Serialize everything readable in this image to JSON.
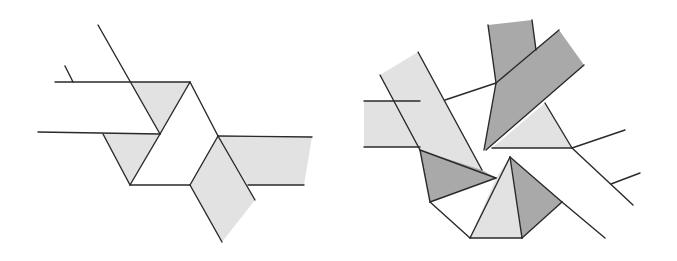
{
  "figure": {
    "colors": {
      "stroke": "#2a2a2a",
      "light_fill": "#e2e2e2",
      "dark_fill": "#a9a9a9",
      "background": "#ffffff"
    },
    "left_figure": {
      "light_regions": [
        "130,82 190,82 160,134",
        "103,134 160,134 130,185",
        "218,136 312,137 304,185 248,185",
        "218,136 190,185 222,242 255,200"
      ],
      "lines": [
        "55,82 190,82",
        "65,66 73,82",
        "98,25 160,134",
        "38,132 160,134",
        "103,134 130,185",
        "190,82 160,134",
        "160,134 130,185",
        "130,185 190,185",
        "190,82 218,136",
        "218,136 190,185",
        "218,136 312,137",
        "248,185 304,185",
        "218,136 255,200",
        "190,185 222,242"
      ]
    },
    "right_figure": {
      "light_regions": [
        "364,101 420,101 432,147 364,147",
        "380,75 418,52 482,170 420,150",
        "545,103 572,148 492,148",
        "470,238 522,238 510,157 496,178"
      ],
      "dark_regions": [
        "488,25 532,20 536,50 496,83",
        "496,83 559,30 584,65 486,150 484,148",
        "420,150 482,170 496,178 430,202",
        "510,157 522,238 562,202"
      ],
      "lines": [
        "364,101 420,101",
        "364,147 420,147",
        "380,75 420,150",
        "418,52 482,170",
        "445,100 496,83",
        "488,25 496,83",
        "532,20 536,50",
        "496,83 559,30",
        "584,65 486,150",
        "496,83 484,150",
        "545,103 572,148",
        "492,148 572,148",
        "572,148 625,130",
        "572,148 633,205",
        "611,184 640,173",
        "420,150 430,202",
        "420,150 496,178",
        "430,202 496,178",
        "430,202 470,238",
        "470,238 522,238",
        "470,238 510,157",
        "510,157 522,238",
        "522,238 562,202",
        "510,157 562,202",
        "562,202 605,238"
      ]
    }
  }
}
